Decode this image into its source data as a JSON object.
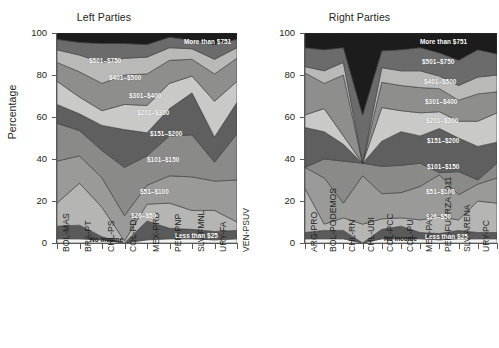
{
  "figure": {
    "ylabel": "Percentage",
    "y_ticks": [
      "0",
      "20",
      "40",
      "60",
      "80",
      "100"
    ]
  },
  "panels": {
    "left": {
      "title": "Left Parties"
    },
    "right": {
      "title": "Right Parties"
    }
  },
  "band_labels": {
    "more_than_751": "More than $751",
    "b501_750": "$501–$750",
    "b401_500": "$401–$500",
    "b301_400": "$301–$400",
    "b201_300": "$201–$300",
    "b151_200": "$151–$200",
    "b101_150": "$101–$150",
    "b51_100": "$51–$100",
    "b26_50": "$26–$50",
    "less_than_25": "Less than $25",
    "no_income": "No income"
  },
  "chart_data": {
    "type": "area",
    "xlabel": "",
    "ylabel": "Percentage",
    "ylim": [
      0,
      100
    ],
    "grid": false,
    "legend_position": "inline-band-labels",
    "stacked": true,
    "stack_order_bottom_to_top": [
      "No income",
      "Less than $25",
      "$26–$50",
      "$51–$100",
      "$101–$150",
      "$151–$200",
      "$201–$300",
      "$301–$400",
      "$401–$500",
      "$501–$750",
      "More than $751"
    ],
    "colors": {
      "No income": "#f2f2f0",
      "Less than $25": "#5a5a5a",
      "$26–$50": "#b5b5b3",
      "$51–$100": "#9a9a98",
      "$101–$150": "#8a8a88",
      "$151–$200": "#5f5f5f",
      "$201–$300": "#c9c9c7",
      "$301–$400": "#8e8e8c",
      "$401–$500": "#b9b9b7",
      "$501–$750": "#6b6b6b",
      "More than $751": "#1c1c1c"
    },
    "panels": [
      {
        "name": "Left Parties",
        "categories": [
          "BOL-MAS",
          "BRA-PT",
          "CHL-PS",
          "COL-PDA",
          "MEX-PRD",
          "PER-PNP",
          "SLV-FMNL",
          "URY-FA",
          "VEN-PSUV"
        ],
        "series": [
          {
            "name": "No income",
            "values": [
              2.0,
              2.0,
              1.5,
              0.0,
              1.5,
              2.0,
              2.0,
              1.5,
              2.0
            ]
          },
          {
            "name": "Less than $25",
            "values": [
              6.0,
              6.5,
              1.5,
              0.0,
              9.0,
              5.0,
              4.5,
              4.0,
              4.0
            ]
          },
          {
            "name": "$26–$50",
            "values": [
              11.0,
              20.0,
              14.0,
              1.0,
              8.0,
              12.0,
              9.0,
              10.0,
              4.0
            ]
          },
          {
            "name": "$51–$100",
            "values": [
              20.0,
              13.0,
              14.0,
              12.0,
              9.0,
              13.0,
              16.0,
              14.0,
              20.0
            ]
          },
          {
            "name": "$101–$150",
            "values": [
              18.0,
              12.0,
              13.0,
              23.0,
              14.0,
              19.0,
              20.0,
              9.0,
              22.0
            ]
          },
          {
            "name": "$151–$200",
            "values": [
              9.0,
              8.0,
              12.0,
              18.0,
              11.0,
              13.0,
              20.0,
              12.0,
              15.0
            ]
          },
          {
            "name": "$201–$300",
            "values": [
              11.0,
              8.0,
              7.0,
              12.0,
              13.0,
              12.0,
              8.0,
              17.0,
              10.0
            ]
          },
          {
            "name": "$301–$400",
            "values": [
              9.0,
              12.0,
              13.0,
              14.0,
              15.0,
              11.0,
              8.0,
              13.0,
              11.0
            ]
          },
          {
            "name": "$401–$500",
            "values": [
              6.0,
              8.0,
              10.0,
              8.0,
              8.0,
              6.0,
              5.0,
              7.0,
              5.0
            ]
          },
          {
            "name": "$501–$750",
            "values": [
              5.0,
              6.0,
              9.0,
              7.0,
              6.0,
              5.0,
              4.0,
              7.0,
              4.0
            ]
          },
          {
            "name": "More than $751",
            "values": [
              3.0,
              4.5,
              5.0,
              5.0,
              5.5,
              2.0,
              3.5,
              5.5,
              3.0
            ]
          }
        ]
      },
      {
        "name": "Right Parties",
        "categories": [
          "ARG-PRO",
          "BOL-PODEMOS",
          "CHL-RN",
          "CHL-UDI",
          "COL-PCC",
          "COL-PU",
          "MEX-PAN",
          "PER-FUERZA 2011",
          "SLV-ARENA",
          "URY-PC",
          "URY-PN"
        ],
        "series": [
          {
            "name": "No income",
            "values": [
              2.0,
              2.0,
              2.0,
              0.0,
              2.0,
              2.0,
              2.0,
              1.5,
              2.0,
              2.0,
              2.0
            ]
          },
          {
            "name": "Less than $25",
            "values": [
              3.0,
              4.0,
              4.0,
              0.0,
              4.5,
              6.0,
              3.0,
              3.0,
              4.0,
              3.0,
              3.0
            ]
          },
          {
            "name": "$26–$50",
            "values": [
              21.0,
              3.0,
              6.0,
              9.0,
              5.0,
              4.0,
              6.0,
              8.0,
              5.0,
              15.0,
              14.0
            ]
          },
          {
            "name": "$51–$100",
            "values": [
              10.0,
              22.0,
              7.0,
              23.0,
              12.0,
              12.0,
              16.0,
              20.0,
              12.0,
              8.0,
              12.0
            ]
          },
          {
            "name": "$101–$150",
            "values": [
              0.0,
              9.0,
              20.0,
              6.0,
              13.0,
              13.0,
              11.0,
              1.0,
              11.0,
              2.0,
              7.0
            ]
          },
          {
            "name": "$151–$200",
            "values": [
              19.0,
              13.0,
              8.0,
              0.0,
              12.0,
              16.0,
              13.0,
              21.0,
              16.0,
              16.0,
              10.0
            ]
          },
          {
            "name": "$201–$300",
            "values": [
              6.0,
              11.0,
              4.0,
              0.0,
              16.0,
              10.0,
              11.0,
              8.0,
              8.0,
              12.0,
              14.0
            ]
          },
          {
            "name": "$301–$400",
            "values": [
              20.0,
              12.0,
              29.0,
              0.0,
              12.0,
              12.0,
              12.0,
              11.0,
              10.0,
              13.0,
              10.0
            ]
          },
          {
            "name": "$401–$500",
            "values": [
              3.0,
              6.0,
              6.0,
              0.0,
              7.0,
              7.0,
              8.0,
              6.0,
              7.0,
              8.0,
              8.0
            ]
          },
          {
            "name": "$501–$750",
            "values": [
              9.0,
              10.0,
              7.0,
              23.0,
              8.0,
              10.0,
              11.0,
              11.0,
              12.0,
              13.0,
              10.0
            ]
          },
          {
            "name": "More than $751",
            "values": [
              7.0,
              8.0,
              7.0,
              39.0,
              8.5,
              8.0,
              7.0,
              9.5,
              13.0,
              8.0,
              10.0
            ]
          }
        ]
      }
    ]
  },
  "band_label_positions": {
    "left": [
      {
        "key": "more_than_751",
        "x": 127,
        "y": 5,
        "dark": false
      },
      {
        "key": "b501_750",
        "x": 32,
        "y": 24,
        "dark": false
      },
      {
        "key": "b401_500",
        "x": 52,
        "y": 41,
        "dark": false
      },
      {
        "key": "b301_400",
        "x": 72,
        "y": 59,
        "dark": false
      },
      {
        "key": "b201_300",
        "x": 80,
        "y": 76,
        "dark": false
      },
      {
        "key": "b151_200",
        "x": 93,
        "y": 97,
        "dark": false
      },
      {
        "key": "b101_150",
        "x": 90,
        "y": 123,
        "dark": false
      },
      {
        "key": "b51_100",
        "x": 83,
        "y": 155,
        "dark": false
      },
      {
        "key": "b26_50",
        "x": 74,
        "y": 179,
        "dark": false
      },
      {
        "key": "less_than_25",
        "x": 118,
        "y": 199,
        "dark": false
      },
      {
        "key": "no_income",
        "x": 33,
        "y": 203,
        "dark": true
      }
    ],
    "right": [
      {
        "key": "more_than_751",
        "x": 115,
        "y": 5,
        "dark": false
      },
      {
        "key": "b501_750",
        "x": 117,
        "y": 25,
        "dark": false
      },
      {
        "key": "b401_500",
        "x": 119,
        "y": 45,
        "dark": false
      },
      {
        "key": "b301_400",
        "x": 120,
        "y": 65,
        "dark": false
      },
      {
        "key": "b201_300",
        "x": 121,
        "y": 84,
        "dark": false
      },
      {
        "key": "b151_200",
        "x": 122,
        "y": 104,
        "dark": false
      },
      {
        "key": "b101_150",
        "x": 122,
        "y": 130,
        "dark": false
      },
      {
        "key": "b51_100",
        "x": 121,
        "y": 155,
        "dark": false
      },
      {
        "key": "b26_50",
        "x": 121,
        "y": 180,
        "dark": false
      },
      {
        "key": "less_than_25",
        "x": 120,
        "y": 200,
        "dark": false
      },
      {
        "key": "no_income",
        "x": 79,
        "y": 202,
        "dark": true
      }
    ]
  }
}
